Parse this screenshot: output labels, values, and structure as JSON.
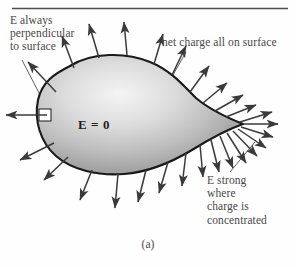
{
  "figure": {
    "caption": "(a)",
    "top_rule_color": "#4d4d4d",
    "background_color": "#fefefe"
  },
  "annotations": {
    "perpendicular": {
      "lines": [
        "E always",
        "perpendicular",
        "to surface"
      ],
      "text": "E always\nperpendicular\nto surface"
    },
    "net_charge": {
      "text": "net charge all on surface"
    },
    "e_strong": {
      "lines": [
        "E strong",
        "where",
        "charge is",
        "concentrated"
      ],
      "text": "E strong\nwhere\ncharge is\nconcentrated"
    },
    "interior_field": {
      "text": "E = 0"
    }
  },
  "conductor": {
    "label": "charged conductor blob",
    "fill_light": "#f2f2f2",
    "fill_mid": "#b9b9b9",
    "fill_dark": "#8d8d8d",
    "outline_color": "#1a1a1a"
  },
  "field_arrows": {
    "color": "#3a3a3a",
    "count_description": "electric field vectors normal to the surface, dense at the pointed tip"
  },
  "right_angle_marker": {
    "description": "small square showing 90 degrees between field vector and surface"
  }
}
